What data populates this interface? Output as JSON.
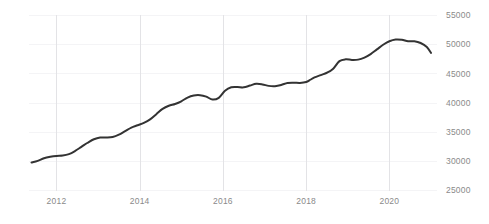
{
  "chart_data": {
    "type": "line",
    "title": "",
    "subtitle": "",
    "xlabel": "",
    "ylabel": "",
    "grid": {
      "vertical": true,
      "horizontal": true,
      "vertical_color": "#e3e3e6",
      "horizontal_color": "#f4f4f6"
    },
    "legend": {
      "visible": false,
      "position": "none",
      "entries": []
    },
    "xlim": [
      2011.4,
      2021.0
    ],
    "ylim": [
      25000,
      55000
    ],
    "x_ticks": [
      2012,
      2014,
      2016,
      2018,
      2020
    ],
    "x_tick_labels": [
      "2012",
      "2014",
      "2016",
      "2018",
      "2020"
    ],
    "y_ticks": [
      25000,
      30000,
      35000,
      40000,
      45000,
      50000,
      55000
    ],
    "y_tick_labels": [
      "25000",
      "30000",
      "35000",
      "40000",
      "45000",
      "50000",
      "55000"
    ],
    "y_axis_position": "right",
    "series": [
      {
        "name": "value",
        "color": "#333333",
        "line_width": 2,
        "x": [
          2011.4,
          2011.55,
          2011.7,
          2011.85,
          2012.0,
          2012.15,
          2012.3,
          2012.45,
          2012.6,
          2012.75,
          2012.9,
          2013.05,
          2013.2,
          2013.35,
          2013.5,
          2013.65,
          2013.8,
          2013.95,
          2014.1,
          2014.25,
          2014.4,
          2014.55,
          2014.7,
          2014.85,
          2015.0,
          2015.15,
          2015.3,
          2015.45,
          2015.6,
          2015.75,
          2015.9,
          2016.05,
          2016.2,
          2016.35,
          2016.5,
          2016.65,
          2016.8,
          2016.95,
          2017.1,
          2017.25,
          2017.4,
          2017.55,
          2017.7,
          2017.85,
          2018.0,
          2018.1,
          2018.2,
          2018.35,
          2018.5,
          2018.65,
          2018.8,
          2018.95,
          2019.1,
          2019.25,
          2019.4,
          2019.55,
          2019.7,
          2019.85,
          2020.0,
          2020.15,
          2020.3,
          2020.45,
          2020.6,
          2020.75,
          2020.9
        ],
        "y": [
          29700,
          30000,
          30450,
          30700,
          30850,
          30900,
          31150,
          31700,
          32400,
          33100,
          33700,
          34000,
          34000,
          34100,
          34500,
          35100,
          35700,
          36100,
          36500,
          37100,
          38000,
          38900,
          39450,
          39750,
          40200,
          40850,
          41200,
          41250,
          41000,
          40500,
          40800,
          42000,
          42600,
          42650,
          42600,
          42900,
          43200,
          43100,
          42850,
          42800,
          43000,
          43350,
          43400,
          43350,
          43500,
          43900,
          44300,
          44700,
          45100,
          45800,
          47100,
          47400,
          47300,
          47350,
          47700,
          48300,
          49100,
          49900,
          50500,
          50800,
          50750,
          50500,
          50500,
          50200,
          49500
        ]
      }
    ],
    "data_end_value": 48500,
    "data_end_x": 2021.0
  }
}
